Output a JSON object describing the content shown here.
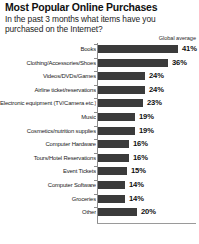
{
  "header": {
    "title": "Most Popular Online Purchases",
    "subtitle": "In the past 3 months what items have you purchased on the Internet?",
    "legend_note": "Global average"
  },
  "chart_data": {
    "type": "bar",
    "orientation": "horizontal",
    "title": "Most Popular Online Purchases",
    "subtitle": "In the past 3 months what items have you purchased on the Internet?",
    "xlabel": "",
    "ylabel": "",
    "xlim": [
      0,
      45
    ],
    "grid": false,
    "legend_position": "top-right",
    "series_label": "Global average",
    "value_suffix": "%",
    "bar_color": "#3b3b3b",
    "axis_color": "#8c8c8c",
    "categories": [
      "Books",
      "Clothing/Accessories/Shoes",
      "Videos/DVDs/Games",
      "Airline ticket/reservations",
      "Electronic equipment (TV/Camera etc.)",
      "Music",
      "Cosmetics/nutrition supplies",
      "Computer Hardware",
      "Tours/Hotel Reservations",
      "Event Tickets",
      "Computer Software",
      "Groceries",
      "Other"
    ],
    "values": [
      41,
      36,
      24,
      24,
      23,
      19,
      19,
      16,
      16,
      15,
      14,
      14,
      20
    ],
    "value_labels": [
      "41%",
      "36%",
      "24%",
      "24%",
      "23%",
      "19%",
      "19%",
      "16%",
      "16%",
      "15%",
      "14%",
      "14%",
      "20%"
    ]
  }
}
